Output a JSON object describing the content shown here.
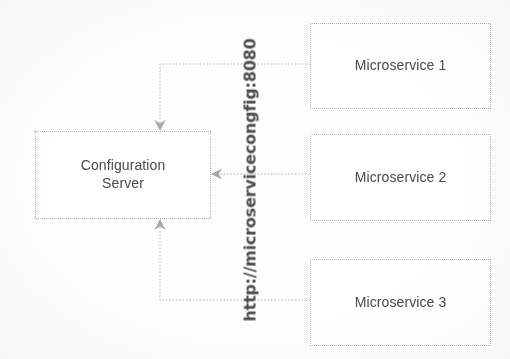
{
  "diagram": {
    "title_text_visible": false,
    "background_color": "#fdfdfd",
    "line_color": "#b4b4b4",
    "text_color": "#4a4a4a",
    "nodes": [
      {
        "id": "config-server",
        "label": "Configuration\nServer",
        "x": 35,
        "y": 131,
        "width": 176,
        "height": 88
      },
      {
        "id": "microservice-1",
        "label": "Microservice 1",
        "x": 310,
        "y": 23,
        "width": 181,
        "height": 86
      },
      {
        "id": "microservice-2",
        "label": "Microservice 2",
        "x": 310,
        "y": 134,
        "width": 181,
        "height": 87
      },
      {
        "id": "microservice-3",
        "label": "Microservice 3",
        "x": 310,
        "y": 259,
        "width": 181,
        "height": 87
      }
    ],
    "edges": [
      {
        "id": "edge-ms1-to-config",
        "from": "microservice-1",
        "to": "config-server",
        "style": "dotted",
        "arrow": "down",
        "path": "M 310 64 L 160 64 L 160 127"
      },
      {
        "id": "edge-ms2-to-config",
        "from": "microservice-2",
        "to": "config-server",
        "style": "dotted",
        "arrow": "left",
        "path": "M 310 174 L 216 174"
      },
      {
        "id": "edge-ms3-to-config",
        "from": "microservice-3",
        "to": "config-server",
        "style": "dotted",
        "arrow": "up",
        "path": "M 310 300 L 160 300 L 160 224"
      }
    ],
    "url_label": "http://microservicecongfig:8080"
  }
}
